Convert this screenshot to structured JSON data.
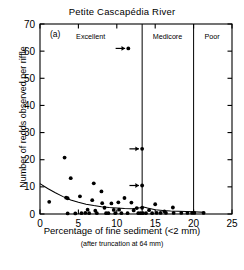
{
  "figure": {
    "panel_label": "(a)",
    "title": "Petite Cascapédia River",
    "xlabel": "Percentage of fine sediment (<2 mm)",
    "xlabel_sub": "(after truncation at 64 mm)",
    "ylabel": "Number of redds observed per riffle"
  },
  "chart_data": {
    "type": "scatter",
    "title": "Petite Cascapédia River",
    "panel_label": "(a)",
    "xlabel": "Percentage of fine sediment (<2 mm)",
    "xlabel_sub": "(after truncation at 64 mm)",
    "ylabel": "Number of redds observed per riffle",
    "xlim": [
      0,
      25
    ],
    "ylim": [
      0,
      70
    ],
    "xticks": [
      0,
      5,
      10,
      15,
      20,
      25
    ],
    "yticks": [
      0,
      10,
      20,
      30,
      40,
      50,
      60,
      70
    ],
    "grid": false,
    "legend": "none",
    "marker": "filled-circle",
    "marker_color": "#000000",
    "line_color": "#000000",
    "points": [
      [
        1.2,
        4.5
      ],
      [
        3.2,
        20.8
      ],
      [
        3.4,
        6.0
      ],
      [
        3.6,
        5.8
      ],
      [
        3.6,
        0.2
      ],
      [
        4.0,
        13.2
      ],
      [
        4.6,
        0.2
      ],
      [
        5.2,
        6.5
      ],
      [
        5.4,
        0.3
      ],
      [
        5.9,
        0.4
      ],
      [
        6.2,
        1.6
      ],
      [
        6.4,
        0.3
      ],
      [
        6.8,
        5.1
      ],
      [
        7.0,
        11.3
      ],
      [
        7.2,
        1.2
      ],
      [
        7.4,
        0.3
      ],
      [
        8.0,
        8.3
      ],
      [
        8.1,
        4.0
      ],
      [
        8.4,
        2.3
      ],
      [
        8.6,
        0.3
      ],
      [
        8.9,
        0.3
      ],
      [
        9.3,
        3.9
      ],
      [
        9.6,
        1.5
      ],
      [
        9.8,
        0.3
      ],
      [
        10.2,
        4.3
      ],
      [
        10.3,
        1.6
      ],
      [
        10.6,
        0.3
      ],
      [
        11.0,
        5.9
      ],
      [
        11.4,
        0.3
      ],
      [
        11.5,
        61.0
      ],
      [
        11.9,
        4.2
      ],
      [
        12.2,
        1.3
      ],
      [
        12.6,
        2.2
      ],
      [
        12.8,
        0.3
      ],
      [
        13.1,
        0.3
      ],
      [
        13.3,
        24.0
      ],
      [
        13.3,
        10.5
      ],
      [
        13.3,
        2.3
      ],
      [
        13.4,
        0.3
      ],
      [
        13.8,
        0.3
      ],
      [
        14.2,
        1.4
      ],
      [
        14.6,
        0.3
      ],
      [
        15.0,
        3.6
      ],
      [
        15.2,
        0.4
      ],
      [
        15.7,
        0.4
      ],
      [
        16.2,
        1.0
      ],
      [
        16.4,
        0.4
      ],
      [
        17.3,
        2.4
      ],
      [
        17.4,
        0.4
      ],
      [
        18.4,
        0.4
      ],
      [
        19.2,
        0.4
      ],
      [
        19.8,
        0.4
      ],
      [
        20.1,
        0.4
      ],
      [
        21.3,
        0.4
      ]
    ],
    "fit_line": {
      "name": "smoothed fit",
      "x": [
        0,
        1,
        2,
        3,
        4,
        5,
        6,
        7,
        8,
        9,
        10,
        11,
        12,
        13,
        13.5,
        14,
        15,
        16,
        17,
        18,
        19,
        20,
        21.5
      ],
      "y": [
        11.2,
        9.4,
        7.8,
        6.4,
        5.2,
        4.3,
        3.6,
        3.1,
        2.7,
        2.4,
        2.2,
        2.0,
        1.9,
        2.3,
        2.6,
        2.2,
        1.6,
        1.3,
        1.1,
        1.0,
        0.9,
        0.8,
        0.6
      ]
    },
    "category_dividers": [
      13.3,
      20.0
    ],
    "categories": [
      {
        "label": "Excellent",
        "x_start": 0,
        "x_end": 13.3,
        "label_x": 6.6
      },
      {
        "label": "Medicore",
        "x_start": 13.3,
        "x_end": 20.0,
        "label_x": 16.6
      },
      {
        "label": "Poor",
        "x_start": 20.0,
        "x_end": 25.0,
        "label_x": 22.4
      }
    ],
    "arrow_annotations": [
      {
        "x": 11.5,
        "y": 61.0,
        "direction": "right"
      },
      {
        "x": 13.3,
        "y": 24.0,
        "direction": "right"
      },
      {
        "x": 13.3,
        "y": 10.5,
        "direction": "right"
      }
    ]
  }
}
